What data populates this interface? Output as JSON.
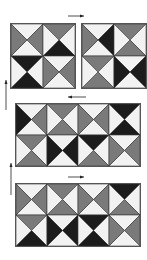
{
  "colors": {
    "white": "#f2f2f2",
    "mid": "#7a7a7a",
    "dark": "#1c1c1c",
    "line": "#333333"
  },
  "blocks": [
    {
      "name": "block-top-left",
      "x": 10,
      "y": 23,
      "cols": 2,
      "rows": 2,
      "cell": 32,
      "squares": [
        [
          "white",
          "mid",
          "white",
          "mid"
        ],
        [
          "mid",
          "white",
          "dark",
          "white"
        ],
        [
          "dark",
          "white",
          "dark",
          "white"
        ],
        [
          "white",
          "mid",
          "white",
          "mid"
        ]
      ]
    },
    {
      "name": "block-top-right",
      "x": 81,
      "y": 23,
      "cols": 2,
      "rows": 2,
      "cell": 32,
      "squares": [
        [
          "white",
          "dark",
          "white",
          "mid"
        ],
        [
          "mid",
          "white",
          "mid",
          "white"
        ],
        [
          "mid",
          "white",
          "mid",
          "white"
        ],
        [
          "white",
          "dark",
          "white",
          "dark"
        ]
      ]
    },
    {
      "name": "block-middle",
      "x": 15,
      "y": 103,
      "cols": 4,
      "rows": 2,
      "cell": 31,
      "squares": [
        [
          "white",
          "mid",
          "white",
          "dark"
        ],
        [
          "mid",
          "white",
          "mid",
          "white"
        ],
        [
          "white",
          "mid",
          "white",
          "mid"
        ],
        [
          "dark",
          "white",
          "dark",
          "white"
        ],
        [
          "mid",
          "white",
          "mid",
          "white"
        ],
        [
          "white",
          "dark",
          "white",
          "dark"
        ],
        [
          "dark",
          "white",
          "mid",
          "white"
        ],
        [
          "white",
          "mid",
          "white",
          "mid"
        ]
      ]
    },
    {
      "name": "block-bottom",
      "x": 15,
      "y": 183,
      "cols": 4,
      "rows": 2,
      "cell": 31,
      "squares": [
        [
          "white",
          "mid",
          "white",
          "mid"
        ],
        [
          "mid",
          "white",
          "mid",
          "white"
        ],
        [
          "white",
          "mid",
          "white",
          "mid"
        ],
        [
          "dark",
          "white",
          "mid",
          "white"
        ],
        [
          "mid",
          "white",
          "dark",
          "white"
        ],
        [
          "white",
          "dark",
          "white",
          "dark"
        ],
        [
          "dark",
          "white",
          "dark",
          "white"
        ],
        [
          "white",
          "mid",
          "white",
          "mid"
        ]
      ]
    }
  ],
  "arrows": [
    {
      "name": "arrow-right-top",
      "x1": 68,
      "y1": 16,
      "x2": 84,
      "y2": 16,
      "dir": "right"
    },
    {
      "name": "arrow-left-middle",
      "x1": 86,
      "y1": 97,
      "x2": 68,
      "y2": 97,
      "dir": "left"
    },
    {
      "name": "arrow-right-bottom",
      "x1": 68,
      "y1": 177,
      "x2": 84,
      "y2": 177,
      "dir": "right"
    },
    {
      "name": "arrow-up-left-1",
      "x1": 6,
      "y1": 110,
      "x2": 6,
      "y2": 80,
      "dir": "up"
    },
    {
      "name": "arrow-up-left-2",
      "x1": 11,
      "y1": 195,
      "x2": 11,
      "y2": 163,
      "dir": "up"
    }
  ]
}
